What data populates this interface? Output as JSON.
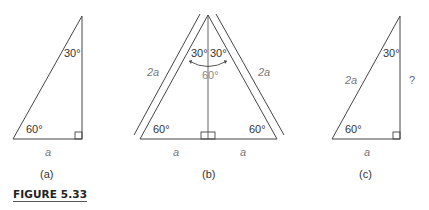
{
  "figure": {
    "title": "FIGURE 5.33",
    "colors": {
      "line": "#444444",
      "label": "#333333",
      "variable": "#777777"
    }
  },
  "panels": {
    "a": {
      "caption": "(a)",
      "top_angle": "30°",
      "bottom_angle": "60°",
      "base": "a"
    },
    "b": {
      "caption": "(b)",
      "top_left_angle": "30°",
      "top_right_angle": "30°",
      "combined_angle": "60°",
      "left_side": "2a",
      "right_side": "2a",
      "bottom_left_angle": "60°",
      "bottom_right_angle": "60°",
      "left_base": "a",
      "right_base": "a"
    },
    "c": {
      "caption": "(c)",
      "top_angle": "30°",
      "hypotenuse": "2a",
      "unknown_side": "?",
      "bottom_angle": "60°",
      "base": "a"
    }
  }
}
